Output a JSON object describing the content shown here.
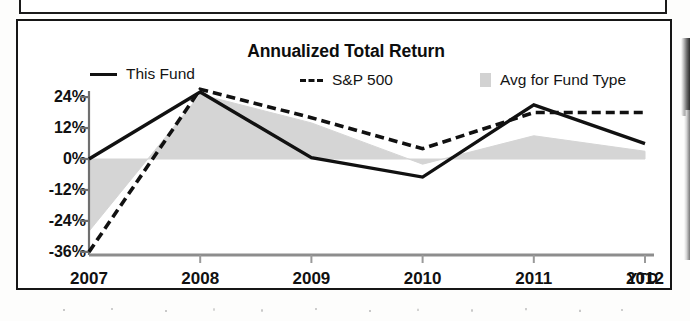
{
  "chart_data": {
    "type": "line",
    "title": "Annualized Total Return",
    "xlabel": "",
    "ylabel": "",
    "x": [
      "2007",
      "2008",
      "2009",
      "2010",
      "2011",
      "2012"
    ],
    "categories": [
      "2007",
      "2008",
      "2009",
      "2010",
      "2011",
      "2012"
    ],
    "x_suffix_label": "YTD",
    "ylim": [
      -40,
      30
    ],
    "yticks": [
      24,
      12,
      0,
      -12,
      -24,
      -36
    ],
    "ytick_labels": [
      "24%",
      "12%",
      "0%",
      "-12%",
      "-24%",
      "-36%"
    ],
    "grid": false,
    "legend_position": "top",
    "zero_line": true,
    "series": [
      {
        "name": "This Fund",
        "style": "solid",
        "color": "#111111",
        "values": [
          0,
          26,
          0.5,
          -7,
          21,
          6
        ]
      },
      {
        "name": "S&P 500",
        "style": "dashed",
        "color": "#111111",
        "values": [
          -36,
          27,
          16,
          4,
          18,
          18
        ]
      },
      {
        "name": "Avg for Fund Type",
        "style": "filled-area",
        "color": "#d2d2d2",
        "values": [
          -28,
          25,
          14,
          -2,
          9,
          3
        ]
      }
    ]
  },
  "legend": {
    "this_fund": "This Fund",
    "sp500": "S&P 500",
    "avg_fund_type": "Avg for Fund Type"
  },
  "axis": {
    "y": [
      "24%",
      "12%",
      "0%",
      "-12%",
      "-24%",
      "-36%"
    ],
    "x": [
      "2007",
      "2008",
      "2009",
      "2010",
      "2011",
      "2012"
    ],
    "ytd": "YTD"
  }
}
